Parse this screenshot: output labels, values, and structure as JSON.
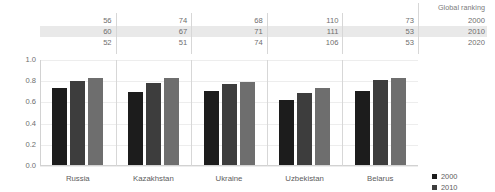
{
  "table": {
    "header_label": "Global ranking",
    "row_years": [
      "2000",
      "2010",
      "2020"
    ],
    "highlight_row_index": 1,
    "rows": [
      {
        "year": "2000",
        "values": [
          "56",
          "74",
          "68",
          "110",
          "73"
        ]
      },
      {
        "year": "2010",
        "values": [
          "60",
          "67",
          "71",
          "111",
          "53"
        ]
      },
      {
        "year": "2020",
        "values": [
          "52",
          "51",
          "74",
          "106",
          "53"
        ]
      }
    ]
  },
  "legend": {
    "items": [
      {
        "label": "2000",
        "color": "#1c1c1c"
      },
      {
        "label": "2010",
        "color": "#3d3d3d"
      },
      {
        "label": "2020",
        "color": "#6e6e6e"
      }
    ]
  },
  "chart_data": {
    "type": "bar",
    "title": "",
    "xlabel": "",
    "ylabel": "",
    "ylim": [
      0.0,
      1.0
    ],
    "yticks": [
      "0.0",
      "0.2",
      "0.4",
      "0.6",
      "0.8",
      "1.0"
    ],
    "ytick_values": [
      0.0,
      0.2,
      0.4,
      0.6,
      0.8,
      1.0
    ],
    "grid": true,
    "legend_position": "right",
    "categories": [
      "Russia",
      "Kazakhstan",
      "Ukraine",
      "Uzbekistan",
      "Belarus"
    ],
    "series": [
      {
        "name": "2000",
        "color": "#1c1c1c",
        "values": [
          0.725,
          0.69,
          0.7,
          0.615,
          0.695
        ]
      },
      {
        "name": "2010",
        "color": "#3d3d3d",
        "values": [
          0.79,
          0.77,
          0.765,
          0.68,
          0.8
        ]
      },
      {
        "name": "2020",
        "color": "#6e6e6e",
        "values": [
          0.825,
          0.825,
          0.785,
          0.73,
          0.825
        ]
      }
    ]
  }
}
